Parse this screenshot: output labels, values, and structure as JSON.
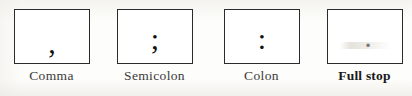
{
  "figure": {
    "caption_style": "punctuation-marks-chart",
    "background_color": "#fdfdfb",
    "box_border_color": "#2b2b2b",
    "label_color": "#3a3a3a",
    "items": [
      {
        "glyph": ",",
        "glyph_name": "comma-mark",
        "label": "Comma",
        "emphasis": "normal"
      },
      {
        "glyph": ";",
        "glyph_name": "semicolon-mark",
        "label": "Semicolon",
        "emphasis": "normal"
      },
      {
        "glyph": ":",
        "glyph_name": "colon-mark",
        "label": "Colon",
        "emphasis": "normal"
      },
      {
        "glyph": ".",
        "glyph_name": "full-stop-mark",
        "label": "Full stop",
        "emphasis": "bold"
      }
    ]
  }
}
